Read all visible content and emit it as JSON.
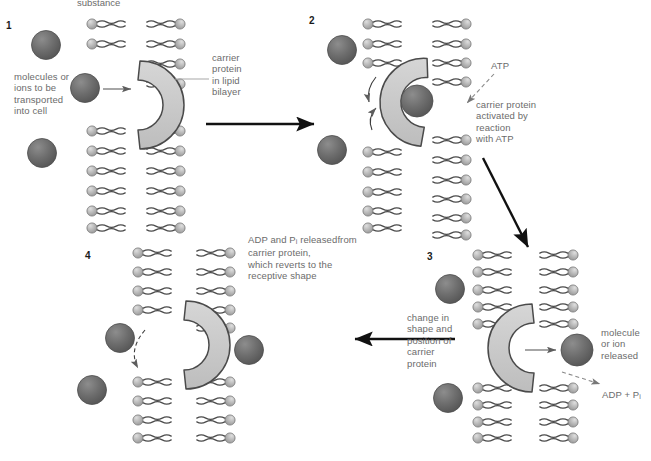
{
  "figure": {
    "clipped_top_text": "substance",
    "background_color": "#ffffff",
    "label_color": "#6b6b6b",
    "number_color": "#1a1a1a",
    "protein_fill": "#c9c9c9",
    "protein_stroke": "#4a4a4a",
    "molecule_fill": "#6e6e6e",
    "phospholipid_head_fill": "#b5b5b5",
    "tail_stroke": "#4a4a4a"
  },
  "panels": [
    {
      "number": "1",
      "labels": [
        {
          "name": "molecules-to-transport",
          "text": "molecules or\nions to be\ntransported\ninto cell"
        },
        {
          "name": "carrier-protein-bilayer",
          "text": "carrier\nprotein\nin lipid\nbilayer"
        }
      ]
    },
    {
      "number": "2",
      "labels": [
        {
          "name": "atp",
          "text": "ATP"
        },
        {
          "name": "carrier-activated",
          "text": "carrier protein\nactivated by\nreaction\nwith ATP"
        }
      ]
    },
    {
      "number": "3",
      "labels": [
        {
          "name": "change-in-shape",
          "text": "change in\nshape and\nposition of\ncarrier\nprotein"
        },
        {
          "name": "molecule-released",
          "text": "molecule\nor ion\nreleased"
        },
        {
          "name": "adp-plus-pi",
          "text": "ADP + Pi",
          "text_main": "ADP + P",
          "subscript": "i"
        }
      ]
    },
    {
      "number": "4",
      "labels": [
        {
          "name": "adp-pi-released",
          "text_line1_main": "ADP and P",
          "text_line1_sub": "i",
          "text_line1_rest": " released",
          "text_rest": "from carrier protein,\nwhich reverts to the\nreceptive shape"
        }
      ]
    }
  ],
  "flow_arrows": [
    {
      "name": "arrow-panel1-to-panel2",
      "direction": "right"
    },
    {
      "name": "arrow-panel2-to-panel3",
      "direction": "down-right"
    },
    {
      "name": "arrow-panel3-to-panel4",
      "direction": "left"
    }
  ]
}
